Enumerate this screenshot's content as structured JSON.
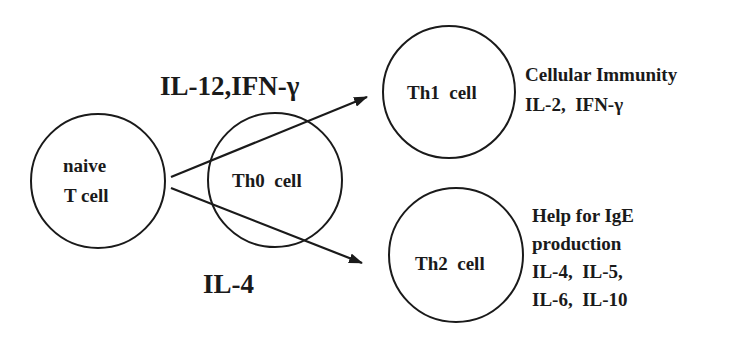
{
  "diagram": {
    "nodes": {
      "naive": {
        "line1": "naive",
        "line2": "T cell"
      },
      "th0": {
        "label": "Th0  cell"
      },
      "th1": {
        "label": "Th1  cell"
      },
      "th2": {
        "label": "Th2  cell"
      }
    },
    "edges": {
      "to_th1": {
        "label": "IL-12,IFN-γ"
      },
      "to_th2": {
        "label": "IL-4"
      }
    },
    "annotations": {
      "th1": {
        "line1": "Cellular Immunity",
        "line2": "IL-2,  IFN-γ"
      },
      "th2": {
        "line1": "Help for IgE",
        "line2": "production",
        "line3": "IL-4,  IL-5,",
        "line4": "IL-6,  IL-10"
      }
    },
    "colors": {
      "stroke": "#1a1a1a",
      "background": "#ffffff"
    }
  }
}
